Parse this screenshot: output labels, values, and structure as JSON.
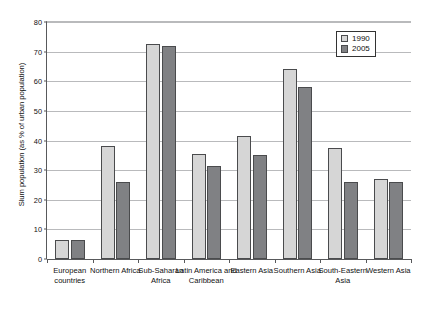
{
  "chart_data": {
    "type": "bar",
    "title": "",
    "xlabel": "",
    "ylabel": "Slum population (as % of urban population)",
    "ylim": [
      0,
      80
    ],
    "ytick_step": 10,
    "yticks": [
      0,
      10,
      20,
      30,
      40,
      50,
      60,
      70,
      80
    ],
    "grid": true,
    "legend_position": "top-right",
    "categories": [
      "European countries",
      "Northern Africa",
      "Sub-Saharan Africa",
      "Latin America and Caribbean",
      "Eastern Asia",
      "Southern Asia",
      "South-Eastern Asia",
      "Western Asia"
    ],
    "series": [
      {
        "name": "1990",
        "color": "#d6d6d6",
        "values": [
          6.5,
          38,
          72.5,
          35.5,
          41.5,
          64,
          37.5,
          27
        ]
      },
      {
        "name": "2005",
        "color": "#808184",
        "values": [
          6.5,
          26,
          72,
          31.5,
          35,
          58,
          26,
          26
        ]
      }
    ]
  },
  "legend": {
    "items": [
      {
        "label": "1990"
      },
      {
        "label": "2005"
      }
    ]
  }
}
